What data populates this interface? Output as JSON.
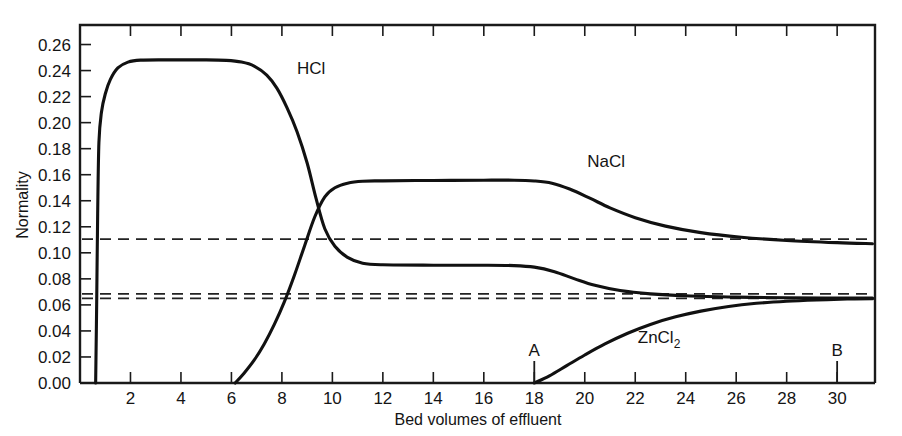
{
  "chart_data": {
    "type": "line",
    "title": "",
    "xlabel": "Bed volumes of effluent",
    "ylabel": "Normality",
    "xlim": [
      0,
      31.5
    ],
    "ylim": [
      0.0,
      0.275
    ],
    "grid": false,
    "legend_position": "inline-curve-labels",
    "x_ticks": [
      2,
      4,
      6,
      8,
      10,
      12,
      14,
      16,
      18,
      20,
      22,
      24,
      26,
      28,
      30
    ],
    "x_tick_labels": [
      "2",
      "4",
      "6",
      "8",
      "10",
      "12",
      "14",
      "16",
      "18",
      "20",
      "22",
      "24",
      "26",
      "28",
      "30"
    ],
    "y_ticks": [
      0.0,
      0.02,
      0.04,
      0.06,
      0.08,
      0.1,
      0.12,
      0.14,
      0.16,
      0.18,
      0.2,
      0.22,
      0.24,
      0.26
    ],
    "y_tick_labels": [
      "0.00",
      "0.02",
      "0.04",
      "0.06",
      "0.08",
      "0.10",
      "0.12",
      "0.14",
      "0.16",
      "0.18",
      "0.20",
      "0.22",
      "0.24",
      "0.26"
    ],
    "series": [
      {
        "name": "HCl",
        "label": "HCl",
        "label_x": 8.6,
        "label_y": 0.237,
        "points": [
          [
            0.62,
            0.0
          ],
          [
            0.66,
            0.06
          ],
          [
            0.7,
            0.13
          ],
          [
            0.75,
            0.185
          ],
          [
            0.85,
            0.208
          ],
          [
            1.0,
            0.222
          ],
          [
            1.2,
            0.233
          ],
          [
            1.5,
            0.242
          ],
          [
            1.9,
            0.2465
          ],
          [
            2.4,
            0.248
          ],
          [
            3.5,
            0.2482
          ],
          [
            5.0,
            0.2482
          ],
          [
            5.8,
            0.2478
          ],
          [
            6.4,
            0.2465
          ],
          [
            6.9,
            0.2435
          ],
          [
            7.4,
            0.2365
          ],
          [
            7.8,
            0.2265
          ],
          [
            8.2,
            0.2115
          ],
          [
            8.6,
            0.193
          ],
          [
            9.0,
            0.169
          ],
          [
            9.35,
            0.142
          ],
          [
            9.7,
            0.1185
          ],
          [
            10.1,
            0.105
          ],
          [
            10.6,
            0.0965
          ],
          [
            11.2,
            0.092
          ],
          [
            12.0,
            0.0908
          ],
          [
            14.0,
            0.0905
          ],
          [
            16.0,
            0.0905
          ],
          [
            17.2,
            0.0902
          ],
          [
            18.0,
            0.089
          ],
          [
            18.8,
            0.0855
          ],
          [
            19.6,
            0.08
          ],
          [
            20.4,
            0.075
          ],
          [
            21.4,
            0.071
          ],
          [
            22.6,
            0.0685
          ],
          [
            24.0,
            0.067
          ],
          [
            26.0,
            0.066
          ],
          [
            28.0,
            0.0655
          ],
          [
            31.4,
            0.0652
          ]
        ]
      },
      {
        "name": "NaCl",
        "label": "NaCl",
        "label_x": 20.1,
        "label_y": 0.166,
        "points": [
          [
            6.15,
            0.0
          ],
          [
            6.5,
            0.0075
          ],
          [
            6.9,
            0.0175
          ],
          [
            7.3,
            0.03
          ],
          [
            7.7,
            0.045
          ],
          [
            8.1,
            0.0625
          ],
          [
            8.5,
            0.083
          ],
          [
            8.9,
            0.1055
          ],
          [
            9.3,
            0.1275
          ],
          [
            9.7,
            0.143
          ],
          [
            10.1,
            0.15
          ],
          [
            10.6,
            0.1535
          ],
          [
            11.2,
            0.155
          ],
          [
            12.0,
            0.1553
          ],
          [
            14.0,
            0.1556
          ],
          [
            16.0,
            0.1558
          ],
          [
            17.2,
            0.1558
          ],
          [
            18.0,
            0.1552
          ],
          [
            18.7,
            0.1535
          ],
          [
            19.4,
            0.149
          ],
          [
            20.2,
            0.142
          ],
          [
            21.0,
            0.1345
          ],
          [
            22.0,
            0.127
          ],
          [
            23.2,
            0.1205
          ],
          [
            24.6,
            0.1155
          ],
          [
            26.2,
            0.112
          ],
          [
            28.0,
            0.1095
          ],
          [
            30.0,
            0.1078
          ],
          [
            31.4,
            0.107
          ]
        ]
      },
      {
        "name": "ZnCl2",
        "label": "ZnCl",
        "label_sub": "2",
        "label_x": 22.1,
        "label_y": 0.0305,
        "points": [
          [
            18.0,
            0.0
          ],
          [
            18.6,
            0.0055
          ],
          [
            19.3,
            0.0135
          ],
          [
            20.0,
            0.0215
          ],
          [
            20.8,
            0.03
          ],
          [
            21.7,
            0.0382
          ],
          [
            22.6,
            0.045
          ],
          [
            23.6,
            0.0508
          ],
          [
            24.6,
            0.0552
          ],
          [
            25.7,
            0.0588
          ],
          [
            26.8,
            0.0612
          ],
          [
            28.0,
            0.0628
          ],
          [
            29.2,
            0.0638
          ],
          [
            30.4,
            0.0645
          ],
          [
            31.4,
            0.0648
          ]
        ]
      }
    ],
    "reference_lines": [
      {
        "name": "upper-reference",
        "value": 0.1105,
        "style": "dashed"
      },
      {
        "name": "mid-reference",
        "value": 0.0685,
        "style": "dashed"
      },
      {
        "name": "lower-reference",
        "value": 0.065,
        "style": "dashed"
      }
    ],
    "markers": [
      {
        "name": "A",
        "label": "A",
        "x": 18.0
      },
      {
        "name": "B",
        "label": "B",
        "x": 30.0
      }
    ]
  }
}
